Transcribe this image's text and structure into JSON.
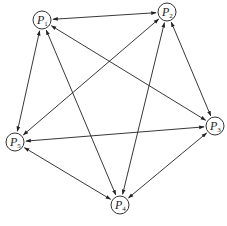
{
  "diagram": {
    "type": "directed-graph",
    "nodes": [
      {
        "id": "P1",
        "label": "P",
        "sub": "1"
      },
      {
        "id": "P2",
        "label": "P",
        "sub": "2"
      },
      {
        "id": "P3",
        "label": "P",
        "sub": "3"
      },
      {
        "id": "P4",
        "label": "P",
        "sub": "4"
      },
      {
        "id": "P5",
        "label": "P",
        "sub": "5"
      }
    ],
    "edges": [
      {
        "from": "P1",
        "to": "P2",
        "bidirectional": true
      },
      {
        "from": "P1",
        "to": "P3",
        "bidirectional": true
      },
      {
        "from": "P1",
        "to": "P4",
        "bidirectional": true
      },
      {
        "from": "P1",
        "to": "P5",
        "bidirectional": true
      },
      {
        "from": "P2",
        "to": "P3",
        "bidirectional": true
      },
      {
        "from": "P2",
        "to": "P4",
        "bidirectional": true
      },
      {
        "from": "P2",
        "to": "P5",
        "bidirectional": true
      },
      {
        "from": "P3",
        "to": "P4",
        "bidirectional": true
      },
      {
        "from": "P3",
        "to": "P5",
        "bidirectional": true
      },
      {
        "from": "P4",
        "to": "P5",
        "bidirectional": true
      }
    ]
  }
}
